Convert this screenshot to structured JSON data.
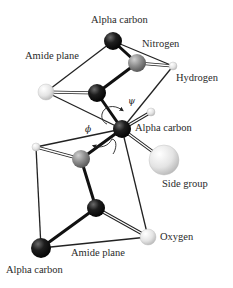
{
  "diagram": {
    "labels": {
      "alpha_carbon_top": "Alpha carbon",
      "nitrogen": "Nitrogen",
      "amide_plane_top": "Amide plane",
      "hydrogen": "Hydrogen",
      "psi": "ψ",
      "phi": "ϕ",
      "alpha_carbon_middle": "Alpha carbon",
      "side_group": "Side group",
      "oxygen": "Oxygen",
      "amide_plane_bottom": "Amide plane",
      "alpha_carbon_bottom": "Alpha carbon"
    },
    "colors": {
      "carbon": "#1a1a1a",
      "nitrogen": "#8a8a8a",
      "light_atom": "#e6e6e6",
      "bond": "#111111",
      "plane_edge": "#222222"
    },
    "atoms": [
      {
        "id": "ca_top",
        "type": "carbon",
        "x": 113,
        "y": 41,
        "r": 9
      },
      {
        "id": "n_top",
        "type": "nitrogen",
        "x": 137,
        "y": 63,
        "r": 9
      },
      {
        "id": "h_top",
        "type": "hydrogen",
        "x": 173,
        "y": 66,
        "r": 4
      },
      {
        "id": "c_top",
        "type": "carbon",
        "x": 97,
        "y": 93,
        "r": 9
      },
      {
        "id": "o_top",
        "type": "oxygen",
        "x": 46,
        "y": 92,
        "r": 8
      },
      {
        "id": "ca_mid",
        "type": "carbon",
        "x": 122,
        "y": 129,
        "r": 9
      },
      {
        "id": "h_mid",
        "type": "hydrogen",
        "x": 151,
        "y": 112,
        "r": 4
      },
      {
        "id": "side",
        "type": "side_group",
        "x": 164,
        "y": 160,
        "r": 15
      },
      {
        "id": "h_left",
        "type": "hydrogen",
        "x": 36,
        "y": 147,
        "r": 4
      },
      {
        "id": "n_bot",
        "type": "nitrogen",
        "x": 81,
        "y": 159,
        "r": 9
      },
      {
        "id": "c_bot",
        "type": "carbon",
        "x": 96,
        "y": 208,
        "r": 9
      },
      {
        "id": "o_bot",
        "type": "oxygen",
        "x": 148,
        "y": 237,
        "r": 8
      },
      {
        "id": "ca_bot",
        "type": "carbon",
        "x": 41,
        "y": 248,
        "r": 10
      }
    ]
  }
}
